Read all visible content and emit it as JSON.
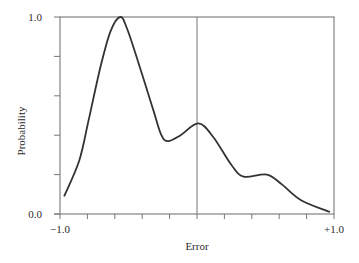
{
  "chart_data": {
    "type": "line",
    "title": "",
    "xlabel": "Error",
    "ylabel": "Probability",
    "xlim": [
      -1.0,
      1.0
    ],
    "ylim": [
      0.0,
      1.0
    ],
    "x_tick_labels": [
      "-1.0",
      "+1.0"
    ],
    "y_tick_labels": [
      "0.0",
      "1.0"
    ],
    "x_ticks": [
      -1.0,
      -0.8,
      -0.6,
      -0.4,
      -0.2,
      0.0,
      0.2,
      0.4,
      0.6,
      0.8,
      1.0
    ],
    "y_ticks": [
      0.0,
      0.2,
      0.4,
      0.6,
      0.8,
      1.0
    ],
    "grid": false,
    "legend": null,
    "reference_line": {
      "orientation": "vertical",
      "x": 0.0
    },
    "series": [
      {
        "name": "Error probability density",
        "x": [
          -0.97,
          -0.86,
          -0.79,
          -0.7,
          -0.63,
          -0.56,
          -0.51,
          -0.41,
          -0.32,
          -0.26,
          -0.21,
          -0.12,
          0.01,
          0.12,
          0.25,
          0.34,
          0.51,
          0.62,
          0.76,
          0.97
        ],
        "y": [
          0.09,
          0.27,
          0.48,
          0.76,
          0.93,
          1.0,
          0.94,
          0.73,
          0.53,
          0.4,
          0.37,
          0.4,
          0.46,
          0.39,
          0.25,
          0.19,
          0.2,
          0.15,
          0.07,
          0.01
        ]
      }
    ]
  },
  "labels": {
    "x_axis": "Error",
    "y_axis": "Probability",
    "x_min": "−1.0",
    "x_max": "+1.0",
    "y_min": "0.0",
    "y_max": "1.0"
  },
  "colors": {
    "axis": "#777777",
    "curve": "#333333",
    "text": "#2b2b2b"
  }
}
